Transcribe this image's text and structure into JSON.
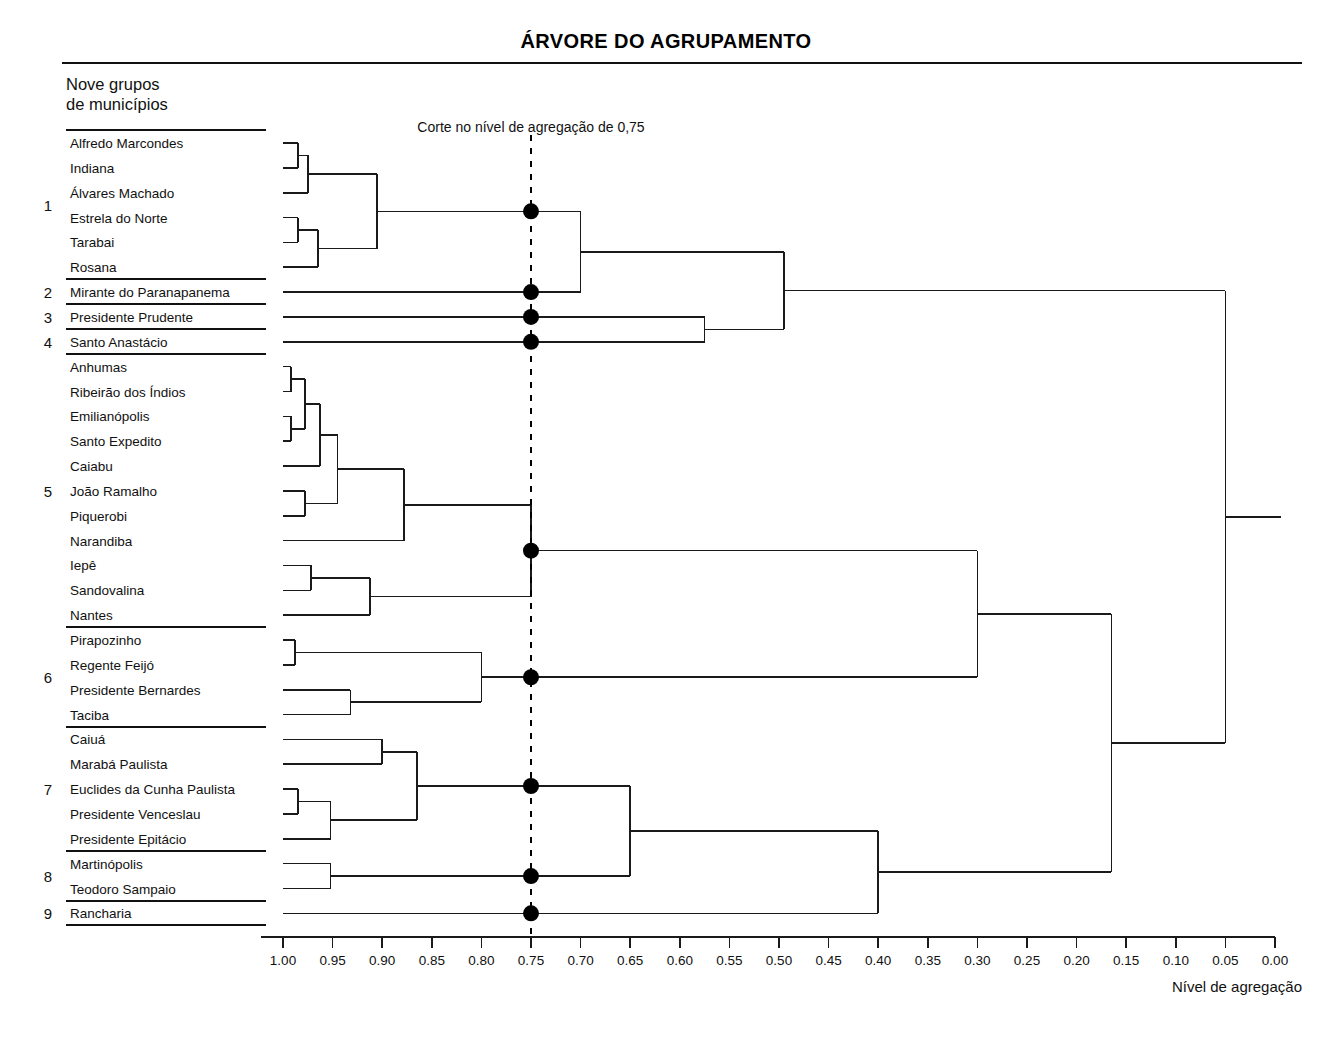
{
  "header": {
    "title": "ÁRVORE DO AGRUPAMENTO",
    "legend_line1": "Nove grupos",
    "legend_line2": "de municípios"
  },
  "annotations": {
    "cut_label": "Corte no nível de agregação de 0,75",
    "cut_value": 0.75,
    "axis_label": "Nível de agregação"
  },
  "colors": {
    "line": "#1a1a1a",
    "node": "#000000",
    "cut_line": "#000000",
    "background": "#ffffff"
  },
  "chart_data": {
    "type": "dendrogram",
    "title": "ÁRVORE DO AGRUPAMENTO",
    "xlabel": "Nível de agregação",
    "ylabel": "",
    "xlim": [
      1.0,
      0.0
    ],
    "x_reversed": true,
    "grid": false,
    "legend_position": "none",
    "cut_level": 0.75,
    "cut_annotation": "Corte no nível de agregação de 0,75",
    "tick_labels": [
      "1.00",
      "0.95",
      "0.90",
      "0.85",
      "0.80",
      "0.75",
      "0.70",
      "0.65",
      "0.60",
      "0.55",
      "0.50",
      "0.45",
      "0.40",
      "0.35",
      "0.30",
      "0.25",
      "0.20",
      "0.15",
      "0.10",
      "0.05",
      "0.00"
    ],
    "tick_values": [
      1.0,
      0.95,
      0.9,
      0.85,
      0.8,
      0.75,
      0.7,
      0.65,
      0.6,
      0.55,
      0.5,
      0.45,
      0.4,
      0.35,
      0.3,
      0.25,
      0.2,
      0.15,
      0.1,
      0.05,
      0.0
    ],
    "groups": [
      {
        "number": "1",
        "members": [
          "Alfredo Marcondes",
          "Indiana",
          "Álvares Machado",
          "Estrela do Norte",
          "Tarabai",
          "Rosana"
        ]
      },
      {
        "number": "2",
        "members": [
          "Mirante do Paranapanema"
        ]
      },
      {
        "number": "3",
        "members": [
          "Presidente Prudente"
        ]
      },
      {
        "number": "4",
        "members": [
          "Santo Anastácio"
        ]
      },
      {
        "number": "5",
        "members": [
          "Anhumas",
          "Ribeirão dos Índios",
          "Emilianópolis",
          "Santo Expedito",
          "Caiabu",
          "João Ramalho",
          "Piquerobi",
          "Narandiba",
          "Iepê",
          "Sandovalina",
          "Nantes"
        ]
      },
      {
        "number": "6",
        "members": [
          "Pirapozinho",
          "Regente Feijó",
          "Presidente Bernardes",
          "Taciba"
        ]
      },
      {
        "number": "7",
        "members": [
          "Caiuá",
          "Marabá Paulista",
          "Euclides da Cunha Paulista",
          "Presidente Venceslau",
          "Presidente Epitácio"
        ]
      },
      {
        "number": "8",
        "members": [
          "Martinópolis",
          "Teodoro Sampaio"
        ]
      },
      {
        "number": "9",
        "members": [
          "Rancharia"
        ]
      }
    ],
    "leaves": [
      "Alfredo Marcondes",
      "Indiana",
      "Álvares Machado",
      "Estrela do Norte",
      "Tarabai",
      "Rosana",
      "Mirante do Paranapanema",
      "Presidente Prudente",
      "Santo Anastácio",
      "Anhumas",
      "Ribeirão dos Índios",
      "Emilianópolis",
      "Santo Expedito",
      "Caiabu",
      "João Ramalho",
      "Piquerobi",
      "Narandiba",
      "Iepê",
      "Sandovalina",
      "Nantes",
      "Pirapozinho",
      "Regente Feijó",
      "Presidente Bernardes",
      "Taciba",
      "Caiuá",
      "Marabá Paulista",
      "Euclides da Cunha Paulista",
      "Presidente Venceslau",
      "Presidente Epitácio",
      "Martinópolis",
      "Teodoro Sampaio",
      "Rancharia"
    ],
    "merges": [
      {
        "id": "m1",
        "left": {
          "leaf": "Alfredo Marcondes"
        },
        "right": {
          "leaf": "Indiana"
        },
        "level": 0.985
      },
      {
        "id": "m2",
        "left": {
          "node": "m1"
        },
        "right": {
          "leaf": "Álvares Machado"
        },
        "level": 0.975
      },
      {
        "id": "m3",
        "left": {
          "leaf": "Estrela do Norte"
        },
        "right": {
          "leaf": "Tarabai"
        },
        "level": 0.985
      },
      {
        "id": "m4",
        "left": {
          "node": "m3"
        },
        "right": {
          "leaf": "Rosana"
        },
        "level": 0.965
      },
      {
        "id": "m5",
        "left": {
          "node": "m2"
        },
        "right": {
          "node": "m4"
        },
        "level": 0.905
      },
      {
        "id": "m6",
        "left": {
          "node": "m5"
        },
        "right": {
          "leaf": "Mirante do Paranapanema"
        },
        "level": 0.7
      },
      {
        "id": "m7",
        "left": {
          "leaf": "Presidente Prudente"
        },
        "right": {
          "leaf": "Santo Anastácio"
        },
        "level": 0.575
      },
      {
        "id": "m8",
        "left": {
          "node": "m6"
        },
        "right": {
          "node": "m7"
        },
        "level": 0.495
      },
      {
        "id": "m9",
        "left": {
          "leaf": "Anhumas"
        },
        "right": {
          "leaf": "Ribeirão dos Índios"
        },
        "level": 0.992
      },
      {
        "id": "m10",
        "left": {
          "leaf": "Emilianópolis"
        },
        "right": {
          "leaf": "Santo Expedito"
        },
        "level": 0.992
      },
      {
        "id": "m11",
        "left": {
          "node": "m9"
        },
        "right": {
          "node": "m10"
        },
        "level": 0.978
      },
      {
        "id": "m12",
        "left": {
          "node": "m11"
        },
        "right": {
          "leaf": "Caiabu"
        },
        "level": 0.963
      },
      {
        "id": "m13",
        "left": {
          "leaf": "João Ramalho"
        },
        "right": {
          "leaf": "Piquerobi"
        },
        "level": 0.978
      },
      {
        "id": "m14",
        "left": {
          "node": "m12"
        },
        "right": {
          "node": "m13"
        },
        "level": 0.945
      },
      {
        "id": "m15",
        "left": {
          "node": "m14"
        },
        "right": {
          "leaf": "Narandiba"
        },
        "level": 0.878
      },
      {
        "id": "m16",
        "left": {
          "leaf": "Iepê"
        },
        "right": {
          "leaf": "Sandovalina"
        },
        "level": 0.972
      },
      {
        "id": "m17",
        "left": {
          "node": "m16"
        },
        "right": {
          "leaf": "Nantes"
        },
        "level": 0.912
      },
      {
        "id": "m18",
        "left": {
          "node": "m15"
        },
        "right": {
          "node": "m17"
        },
        "level": 0.75
      },
      {
        "id": "m19",
        "left": {
          "leaf": "Pirapozinho"
        },
        "right": {
          "leaf": "Regente Feijó"
        },
        "level": 0.988
      },
      {
        "id": "m20",
        "left": {
          "leaf": "Presidente Bernardes"
        },
        "right": {
          "leaf": "Taciba"
        },
        "level": 0.932
      },
      {
        "id": "m21",
        "left": {
          "node": "m19"
        },
        "right": {
          "node": "m20"
        },
        "level": 0.8
      },
      {
        "id": "m22",
        "left": {
          "node": "m18"
        },
        "right": {
          "node": "m21"
        },
        "level": 0.3
      },
      {
        "id": "m23",
        "left": {
          "leaf": "Caiuá"
        },
        "right": {
          "leaf": "Marabá Paulista"
        },
        "level": 0.9
      },
      {
        "id": "m24",
        "left": {
          "leaf": "Euclides da Cunha Paulista"
        },
        "right": {
          "leaf": "Presidente Venceslau"
        },
        "level": 0.985
      },
      {
        "id": "m25",
        "left": {
          "node": "m24"
        },
        "right": {
          "leaf": "Presidente Epitácio"
        },
        "level": 0.952
      },
      {
        "id": "m26",
        "left": {
          "node": "m23"
        },
        "right": {
          "node": "m25"
        },
        "level": 0.865
      },
      {
        "id": "m27",
        "left": {
          "leaf": "Martinópolis"
        },
        "right": {
          "leaf": "Teodoro Sampaio"
        },
        "level": 0.952
      },
      {
        "id": "m28",
        "left": {
          "node": "m26"
        },
        "right": {
          "node": "m27"
        },
        "level": 0.65
      },
      {
        "id": "m29",
        "left": {
          "node": "m28"
        },
        "right": {
          "leaf": "Rancharia"
        },
        "level": 0.4
      },
      {
        "id": "m30",
        "left": {
          "node": "m22"
        },
        "right": {
          "node": "m29"
        },
        "level": 0.165
      },
      {
        "id": "m31",
        "left": {
          "node": "m8"
        },
        "right": {
          "node": "m30"
        },
        "level": 0.05
      }
    ],
    "cut_nodes": [
      {
        "node": "m5",
        "label": "group-1-cut"
      },
      {
        "node": "leaf:Mirante do Paranapanema",
        "label": "group-2-cut"
      },
      {
        "node": "leaf:Presidente Prudente",
        "label": "group-3-cut"
      },
      {
        "node": "leaf:Santo Anastácio",
        "label": "group-4-cut"
      },
      {
        "node": "m18",
        "label": "group-5-cut"
      },
      {
        "node": "m21",
        "label": "group-6-cut"
      },
      {
        "node": "m26",
        "label": "group-7-cut"
      },
      {
        "node": "m27",
        "label": "group-8-cut"
      },
      {
        "node": "leaf:Rancharia",
        "label": "group-9-cut"
      }
    ]
  }
}
